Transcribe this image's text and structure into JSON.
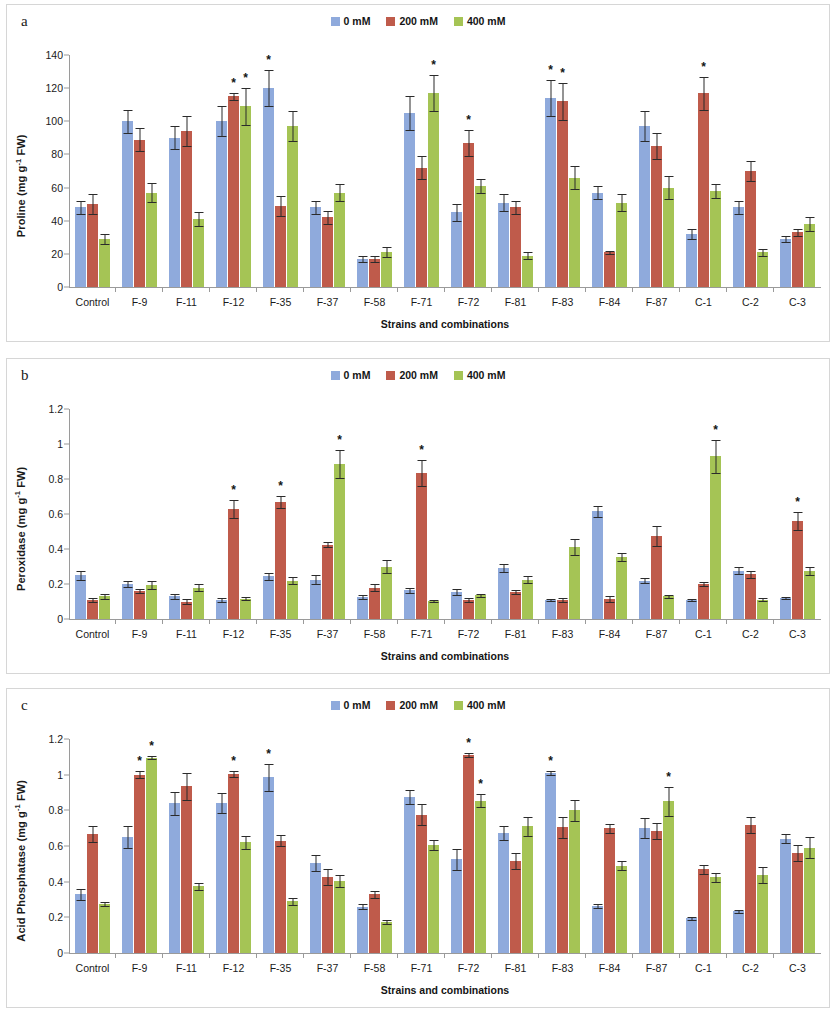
{
  "colors": {
    "series_0": "#8faadc",
    "series_1": "#bf5b4b",
    "series_2": "#a5c455",
    "axis": "#9a9a9a",
    "panel_border": "#d6d6d6",
    "text": "#1a1a1a"
  },
  "panels": [
    {
      "id": "a",
      "label": "a"
    },
    {
      "id": "b",
      "label": "b"
    },
    {
      "id": "c",
      "label": "c"
    }
  ],
  "legend": {
    "entries": [
      {
        "label": "0 mM",
        "color": "#8faadc"
      },
      {
        "label": "200 mM",
        "color": "#bf5b4b"
      },
      {
        "label": "400 mM",
        "color": "#a5c455"
      }
    ]
  },
  "chart_data": [
    {
      "panel": "a",
      "type": "bar",
      "title": "",
      "xlabel": "Strains and combinations",
      "ylabel": "Proline (mg g-1 FW)",
      "ylabel_parts": {
        "pre": "Proline (mg g",
        "sup": "-1",
        "post": " FW)"
      },
      "ylim": [
        0,
        140
      ],
      "yticks": [
        0,
        20,
        40,
        60,
        80,
        100,
        120,
        140
      ],
      "ytick_labels": [
        "0",
        "20",
        "40",
        "60",
        "80",
        "100",
        "120",
        "140"
      ],
      "grid": false,
      "legend_position": "top-center",
      "categories": [
        "Control",
        "F-9",
        "F-11",
        "F-12",
        "F-35",
        "F-37",
        "F-58",
        "F-71",
        "F-72",
        "F-81",
        "F-83",
        "F-84",
        "F-87",
        "C-1",
        "C-2",
        "C-3"
      ],
      "series": [
        {
          "name": "0 mM",
          "values": [
            48,
            100,
            90,
            100,
            120,
            48,
            17,
            105,
            45,
            51,
            114,
            57,
            97,
            32,
            48,
            29
          ],
          "errors": [
            4,
            7,
            7,
            9,
            11,
            4,
            2,
            10,
            5,
            5,
            11,
            4,
            9,
            3,
            4,
            2
          ]
        },
        {
          "name": "200 mM",
          "values": [
            50,
            89,
            94,
            115,
            49,
            42,
            17,
            72,
            87,
            48,
            112,
            21,
            85,
            117,
            70,
            33
          ],
          "errors": [
            6,
            7,
            9,
            2,
            6,
            4,
            2,
            7,
            8,
            4,
            11,
            1,
            8,
            10,
            6,
            2
          ]
        },
        {
          "name": "400 mM",
          "values": [
            29,
            57,
            41,
            109,
            97,
            57,
            21,
            117,
            61,
            19,
            66,
            51,
            60,
            58,
            21,
            38
          ],
          "errors": [
            3,
            6,
            4,
            11,
            9,
            5,
            3,
            11,
            4,
            2,
            7,
            5,
            7,
            4,
            2,
            4
          ]
        }
      ],
      "significance": [
        {
          "category": "F-12",
          "series": "200 mM"
        },
        {
          "category": "F-12",
          "series": "400 mM"
        },
        {
          "category": "F-35",
          "series": "0 mM"
        },
        {
          "category": "F-71",
          "series": "400 mM"
        },
        {
          "category": "F-72",
          "series": "200 mM"
        },
        {
          "category": "F-83",
          "series": "0 mM"
        },
        {
          "category": "F-83",
          "series": "200 mM"
        },
        {
          "category": "C-1",
          "series": "200 mM"
        }
      ],
      "significance_marker": "*"
    },
    {
      "panel": "b",
      "type": "bar",
      "title": "",
      "xlabel": "Strains and combinations",
      "ylabel": "Peroxidase (mg g-1 FW)",
      "ylabel_parts": {
        "pre": "Peroxidase (mg g",
        "sup": "-1",
        "post": " FW)"
      },
      "ylim": [
        0,
        1.2
      ],
      "yticks": [
        0,
        0.2,
        0.4,
        0.6,
        0.8,
        1,
        1.2
      ],
      "ytick_labels": [
        "0",
        "0.2",
        "0.4",
        "0.6",
        "0.8",
        "1",
        "1.2"
      ],
      "grid": false,
      "legend_position": "top-center",
      "categories": [
        "Control",
        "F-9",
        "F-11",
        "F-12",
        "F-35",
        "F-37",
        "F-58",
        "F-71",
        "F-72",
        "F-81",
        "F-83",
        "F-84",
        "F-87",
        "C-1",
        "C-2",
        "C-3"
      ],
      "series": [
        {
          "name": "0 mM",
          "values": [
            0.25,
            0.2,
            0.13,
            0.11,
            0.245,
            0.225,
            0.125,
            0.165,
            0.155,
            0.29,
            0.11,
            0.615,
            0.22,
            0.11,
            0.275,
            0.12
          ],
          "errors": [
            0.025,
            0.015,
            0.015,
            0.01,
            0.02,
            0.025,
            0.012,
            0.015,
            0.015,
            0.022,
            0.006,
            0.03,
            0.012,
            0.006,
            0.02,
            0.006
          ]
        },
        {
          "name": "200 mM",
          "values": [
            0.11,
            0.16,
            0.1,
            0.63,
            0.67,
            0.425,
            0.18,
            0.835,
            0.11,
            0.155,
            0.11,
            0.115,
            0.475,
            0.2,
            0.255,
            0.56
          ],
          "errors": [
            0.012,
            0.012,
            0.012,
            0.05,
            0.035,
            0.015,
            0.02,
            0.075,
            0.012,
            0.012,
            0.012,
            0.015,
            0.055,
            0.012,
            0.02,
            0.05
          ]
        },
        {
          "name": "400 mM",
          "values": [
            0.13,
            0.195,
            0.18,
            0.115,
            0.22,
            0.885,
            0.3,
            0.105,
            0.135,
            0.225,
            0.41,
            0.355,
            0.13,
            0.93,
            0.11,
            0.275
          ],
          "errors": [
            0.015,
            0.025,
            0.022,
            0.008,
            0.022,
            0.08,
            0.035,
            0.006,
            0.008,
            0.02,
            0.045,
            0.025,
            0.008,
            0.095,
            0.008,
            0.025
          ]
        }
      ],
      "significance": [
        {
          "category": "F-12",
          "series": "200 mM"
        },
        {
          "category": "F-35",
          "series": "200 mM"
        },
        {
          "category": "F-37",
          "series": "400 mM"
        },
        {
          "category": "F-71",
          "series": "200 mM"
        },
        {
          "category": "C-1",
          "series": "400 mM"
        },
        {
          "category": "C-3",
          "series": "200 mM"
        }
      ],
      "significance_marker": "*"
    },
    {
      "panel": "c",
      "type": "bar",
      "title": "",
      "xlabel": "Strains and combinations",
      "ylabel": "Acid Phosphatase (mg g-1 FW)",
      "ylabel_parts": {
        "pre": "Acid Phosphatase (mg g",
        "sup": "-1",
        "post": " FW)"
      },
      "ylim": [
        0,
        1.2
      ],
      "yticks": [
        0,
        0.2,
        0.4,
        0.6,
        0.8,
        1,
        1.2
      ],
      "ytick_labels": [
        "0",
        "0.2",
        "0.4",
        "0.6",
        "0.8",
        "1",
        "1.2"
      ],
      "grid": false,
      "legend_position": "top-center",
      "categories": [
        "Control",
        "F-9",
        "F-11",
        "F-12",
        "F-35",
        "F-37",
        "F-58",
        "F-71",
        "F-72",
        "F-81",
        "F-83",
        "F-84",
        "F-87",
        "C-1",
        "C-2",
        "C-3"
      ],
      "series": [
        {
          "name": "0 mM",
          "values": [
            0.33,
            0.65,
            0.84,
            0.84,
            0.985,
            0.505,
            0.26,
            0.875,
            0.525,
            0.675,
            1.01,
            0.265,
            0.7,
            0.195,
            0.235,
            0.64
          ],
          "errors": [
            0.03,
            0.06,
            0.065,
            0.055,
            0.075,
            0.045,
            0.015,
            0.04,
            0.06,
            0.04,
            0.012,
            0.012,
            0.055,
            0.008,
            0.008,
            0.025
          ]
        },
        {
          "name": "200 mM",
          "values": [
            0.67,
            1.0,
            0.935,
            1.005,
            0.63,
            0.425,
            0.33,
            0.775,
            1.11,
            0.515,
            0.705,
            0.7,
            0.685,
            0.47,
            0.72,
            0.56
          ],
          "errors": [
            0.045,
            0.018,
            0.075,
            0.018,
            0.03,
            0.045,
            0.02,
            0.06,
            0.012,
            0.045,
            0.06,
            0.025,
            0.045,
            0.025,
            0.045,
            0.045
          ]
        },
        {
          "name": "400 mM",
          "values": [
            0.275,
            1.095,
            0.375,
            0.62,
            0.29,
            0.405,
            0.175,
            0.605,
            0.855,
            0.71,
            0.8,
            0.49,
            0.85,
            0.425,
            0.44,
            0.59
          ],
          "errors": [
            0.012,
            0.008,
            0.02,
            0.035,
            0.02,
            0.035,
            0.012,
            0.03,
            0.035,
            0.055,
            0.06,
            0.025,
            0.08,
            0.025,
            0.045,
            0.06
          ]
        }
      ],
      "significance": [
        {
          "category": "F-9",
          "series": "200 mM"
        },
        {
          "category": "F-9",
          "series": "400 mM"
        },
        {
          "category": "F-12",
          "series": "200 mM"
        },
        {
          "category": "F-35",
          "series": "0 mM"
        },
        {
          "category": "F-72",
          "series": "200 mM"
        },
        {
          "category": "F-72",
          "series": "400 mM"
        },
        {
          "category": "F-83",
          "series": "0 mM"
        },
        {
          "category": "F-87",
          "series": "400 mM"
        }
      ],
      "significance_marker": "*"
    }
  ]
}
